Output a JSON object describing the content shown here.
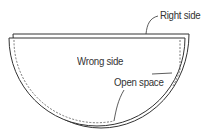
{
  "diagram": {
    "type": "sewing-illustration",
    "labels": {
      "right_side": "Right side",
      "wrong_side": "Wrong side",
      "open_space": "Open space"
    },
    "colors": {
      "stroke": "#333333",
      "background": "#ffffff"
    }
  }
}
